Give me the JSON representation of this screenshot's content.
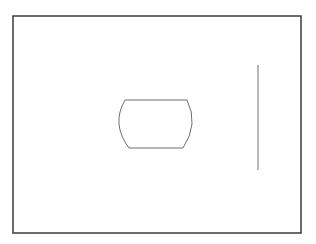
{
  "canvas": {
    "width": 316,
    "height": 244,
    "background": "#ffffff"
  },
  "colors": {
    "frame_stroke": "#3a3a3a",
    "shape_stroke": "#6e6e6e",
    "line_stroke": "#6e6e6e"
  },
  "frame": {
    "x": 13,
    "y": 16,
    "width": 288,
    "height": 217
  },
  "barrel_shape": {
    "path": "M125,100 L187,100 Q199,124 183,148 L129,148 Q111,124 125,100 Z"
  },
  "vertical_line": {
    "x": 258,
    "y1": 65,
    "y2": 170
  }
}
